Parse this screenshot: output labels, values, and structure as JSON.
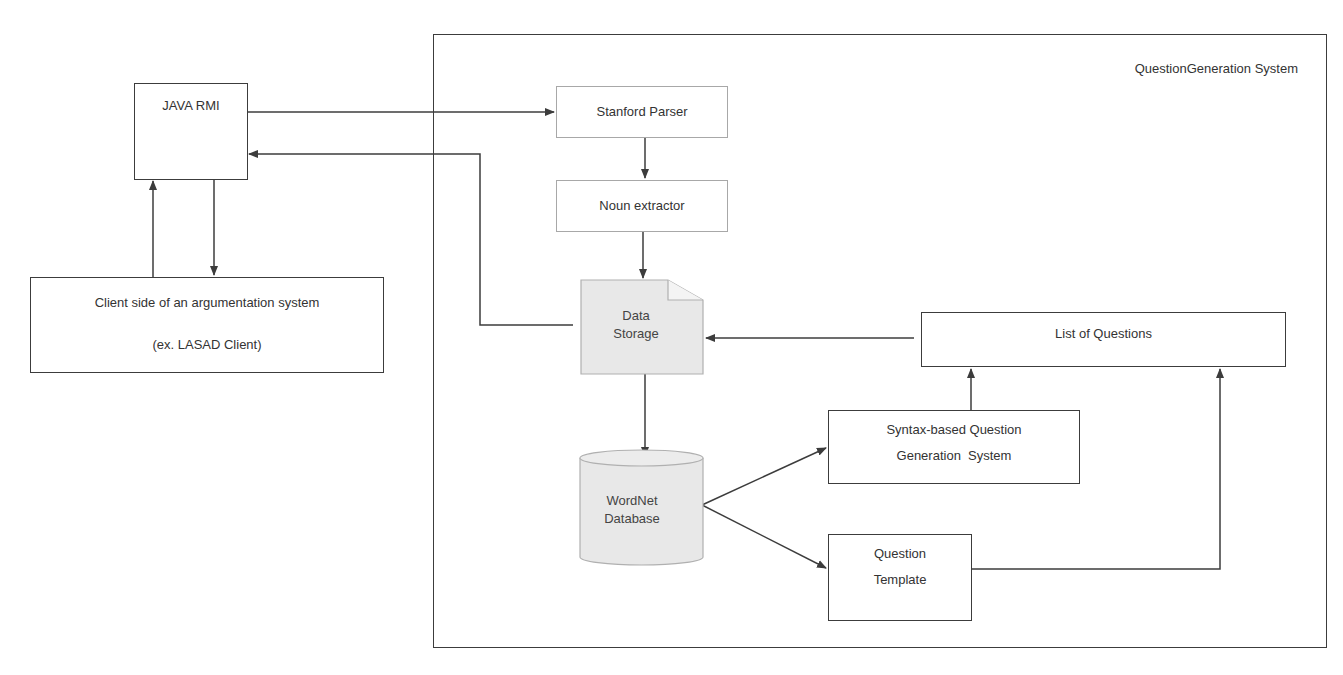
{
  "diagram": {
    "container": {
      "title": "QuestionGeneration System"
    },
    "nodes": {
      "java_rmi": {
        "label": "JAVA RMI"
      },
      "client": {
        "line1": "Client side of an argumentation system",
        "line2": "(ex. LASAD Client)"
      },
      "stanford_parser": {
        "label": "Stanford Parser"
      },
      "noun_extractor": {
        "label": "Noun extractor"
      },
      "data_storage": {
        "line1": "Data",
        "line2": "Storage"
      },
      "wordnet": {
        "line1": "WordNet",
        "line2": "Database"
      },
      "list_of_questions": {
        "label": "List of Questions"
      },
      "syntax_qg": {
        "line1": "Syntax-based Question",
        "line2": "Generation  System"
      },
      "question_template": {
        "line1": "Question",
        "line2": "Template"
      }
    },
    "edges": [
      {
        "from": "JAVA RMI",
        "to": "Stanford Parser"
      },
      {
        "from": "Data Storage",
        "to": "JAVA RMI"
      },
      {
        "from": "JAVA RMI",
        "to": "Client side of an argumentation system"
      },
      {
        "from": "Client side of an argumentation system",
        "to": "JAVA RMI"
      },
      {
        "from": "Stanford Parser",
        "to": "Noun extractor"
      },
      {
        "from": "Noun extractor",
        "to": "Data Storage"
      },
      {
        "from": "Data Storage",
        "to": "WordNet Database"
      },
      {
        "from": "WordNet Database",
        "to": "Syntax-based Question Generation System"
      },
      {
        "from": "WordNet Database",
        "to": "Question Template"
      },
      {
        "from": "Syntax-based Question Generation System",
        "to": "List of Questions"
      },
      {
        "from": "Question Template",
        "to": "List of Questions"
      },
      {
        "from": "List of Questions",
        "to": "Data Storage"
      }
    ],
    "colors": {
      "line": "#3c3c3c",
      "shape_fill": "#e8e8e8",
      "light_border": "#a8a8a8"
    }
  }
}
